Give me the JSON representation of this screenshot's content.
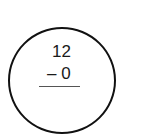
{
  "problem": {
    "minuend": "12",
    "subtrahend_line": "– 0",
    "operator": "minus"
  }
}
